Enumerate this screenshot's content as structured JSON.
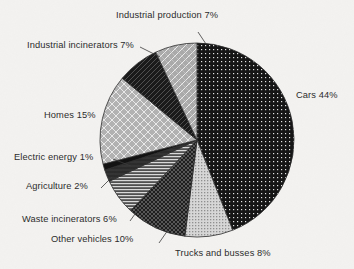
{
  "chart": {
    "type": "pie",
    "title": "",
    "background_color": "#f3f2f0",
    "text_color": "#2b2b2b",
    "center": {
      "x": 197,
      "y": 140
    },
    "radius": 97,
    "start_angle_deg": 0,
    "direction": "clockwise"
  },
  "chart_data": {
    "type": "pie",
    "title": "",
    "subtitle": "",
    "xlabel": "",
    "ylabel": "",
    "legend_position": "none",
    "labels_outside": true,
    "units": "percent",
    "total": 100,
    "categories": [
      "Cars",
      "Trucks and busses",
      "Other vehicles",
      "Waste incinerators",
      "Agriculture",
      "Electric energy",
      "Homes",
      "Industrial incinerators",
      "Industrial production"
    ],
    "values": [
      44,
      8,
      10,
      6,
      2,
      1,
      15,
      7,
      7
    ],
    "slices": [
      {
        "name": "Cars",
        "value": 44,
        "label": "Cars 44%",
        "fill": "black-dotted",
        "fill_color": "#141414",
        "pattern_color": "#e8e8e8"
      },
      {
        "name": "Trucks and busses",
        "value": 8,
        "label": "Trucks and busses 8%",
        "fill": "light-gray-dotted",
        "fill_color": "#cfcfcf",
        "pattern_color": "#f4f4f4"
      },
      {
        "name": "Other vehicles",
        "value": 10,
        "label": "Other vehicles 10%",
        "fill": "dark-crosshatch",
        "fill_color": "#1d1d1d",
        "pattern_color": "#7e7e7e"
      },
      {
        "name": "Waste incinerators",
        "value": 6,
        "label": "Waste incinerators 6%",
        "fill": "horizontal-lines",
        "fill_color": "#5a5a5a",
        "pattern_color": "#d8d8d8"
      },
      {
        "name": "Agriculture",
        "value": 2,
        "label": "Agriculture 2%",
        "fill": "solid-dark",
        "fill_color": "#2a2a2a",
        "pattern_color": "#2a2a2a"
      },
      {
        "name": "Electric energy",
        "value": 1,
        "label": "Electric energy 1%",
        "fill": "solid-black",
        "fill_color": "#111111",
        "pattern_color": "#111111"
      },
      {
        "name": "Homes",
        "value": 15,
        "label": "Homes 15%",
        "fill": "gray-diagonal-grid",
        "fill_color": "#b0b0b0",
        "pattern_color": "#efefef"
      },
      {
        "name": "Industrial incinerators",
        "value": 7,
        "label": "Industrial incinerators 7%",
        "fill": "very-dark-diagonal",
        "fill_color": "#1a1a1a",
        "pattern_color": "#6a6a6a"
      },
      {
        "name": "Industrial production",
        "value": 7,
        "label": "Industrial production 7%",
        "fill": "gray-diagonal-hatch",
        "fill_color": "#a8a8a8",
        "pattern_color": "#ededed"
      }
    ]
  },
  "labels": {
    "industrial_production": "Industrial production 7%",
    "industrial_incinerators": "Industrial incinerators 7%",
    "cars": "Cars 44%",
    "homes": "Homes 15%",
    "electric_energy": "Electric energy 1%",
    "agriculture": "Agriculture 2%",
    "waste_incinerators": "Waste incinerators 6%",
    "other_vehicles": "Other vehicles 10%",
    "trucks_and_busses": "Trucks and busses 8%"
  }
}
